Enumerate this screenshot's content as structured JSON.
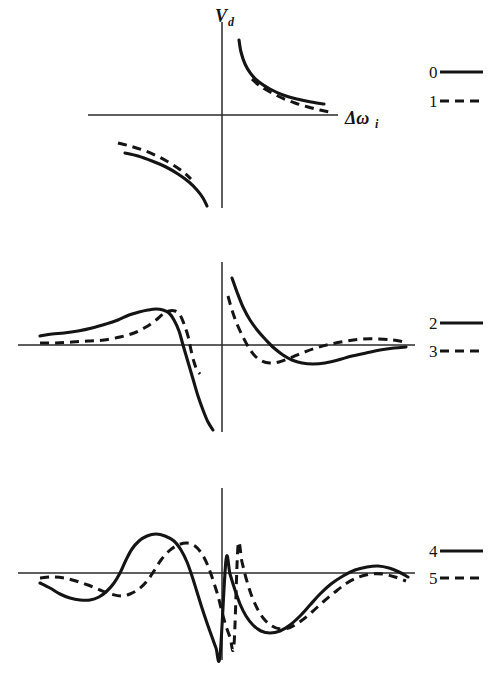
{
  "figure": {
    "background_color": "#ffffff",
    "ink_color": "#141414",
    "axis_color": "#2a2a2a",
    "y_axis_label": "V",
    "y_axis_label_sub": "d",
    "x_axis_label": "Δω",
    "x_axis_label_sub": "i"
  },
  "panels": [
    {
      "name": "top-panel",
      "origin": {
        "x": 222,
        "y": 115
      },
      "x_axis": {
        "x1": 88,
        "x2": 338,
        "y": 115
      },
      "y_axis": {
        "x": 222,
        "y1": 22,
        "y2": 208
      },
      "legend": [
        {
          "label": "0",
          "style": "solid",
          "label_x": 429,
          "line_x1": 440,
          "line_x2": 483,
          "y": 72
        },
        {
          "label": "1",
          "style": "dashed",
          "label_x": 429,
          "line_x1": 440,
          "line_x2": 483,
          "y": 101
        }
      ],
      "curves": [
        {
          "name": "curve-0-upper-right",
          "series": "0",
          "style": "solid",
          "points": [
            [
              239,
              40
            ],
            [
              241,
              52
            ],
            [
              245,
              64
            ],
            [
              251,
              74
            ],
            [
              259,
              82
            ],
            [
              270,
              89
            ],
            [
              283,
              95
            ],
            [
              297,
              99
            ],
            [
              311,
              102
            ],
            [
              324,
              104
            ]
          ]
        },
        {
          "name": "curve-1-upper-right",
          "series": "1",
          "style": "dashed",
          "points": [
            [
              252,
              79
            ],
            [
              260,
              86
            ],
            [
              270,
              92
            ],
            [
              282,
              98
            ],
            [
              295,
              103
            ],
            [
              308,
              107
            ],
            [
              320,
              110
            ],
            [
              330,
              112
            ]
          ]
        },
        {
          "name": "curve-0-lower-left",
          "series": "0",
          "style": "solid",
          "points": [
            [
              125,
              153
            ],
            [
              138,
              156
            ],
            [
              152,
              161
            ],
            [
              166,
              167
            ],
            [
              178,
              174
            ],
            [
              189,
              182
            ],
            [
              197,
              190
            ],
            [
              203,
              198
            ],
            [
              207,
              206
            ]
          ]
        },
        {
          "name": "curve-1-lower-left",
          "series": "1",
          "style": "dashed",
          "points": [
            [
              118,
              143
            ],
            [
              130,
              146
            ],
            [
              143,
              150
            ],
            [
              157,
              156
            ],
            [
              170,
              163
            ],
            [
              182,
              171
            ],
            [
              191,
              179
            ]
          ]
        }
      ]
    },
    {
      "name": "middle-panel",
      "origin": {
        "x": 222,
        "y": 345
      },
      "x_axis": {
        "x1": 18,
        "x2": 415,
        "y": 345
      },
      "y_axis": {
        "x": 222,
        "y1": 262,
        "y2": 432
      },
      "legend": [
        {
          "label": "2",
          "style": "solid",
          "label_x": 429,
          "line_x1": 440,
          "line_x2": 483,
          "y": 323
        },
        {
          "label": "3",
          "style": "dashed",
          "label_x": 429,
          "line_x1": 440,
          "line_x2": 483,
          "y": 351
        }
      ],
      "curves": [
        {
          "name": "curve-2-left-lobe",
          "series": "2",
          "style": "solid",
          "points": [
            [
              40,
              336
            ],
            [
              52,
              334
            ],
            [
              64,
              333
            ],
            [
              78,
              331
            ],
            [
              92,
              328
            ],
            [
              106,
              324
            ],
            [
              118,
              320
            ],
            [
              129,
              315
            ],
            [
              139,
              312
            ],
            [
              148,
              310
            ],
            [
              156,
              309
            ],
            [
              163,
              310
            ],
            [
              169,
              313
            ],
            [
              174,
              320
            ],
            [
              179,
              331
            ],
            [
              183,
              345
            ],
            [
              188,
              362
            ],
            [
              193,
              379
            ],
            [
              198,
              396
            ],
            [
              203,
              410
            ],
            [
              208,
              422
            ],
            [
              213,
              430
            ]
          ]
        },
        {
          "name": "curve-3-left-lobe",
          "series": "3",
          "style": "dashed",
          "points": [
            [
              40,
              343
            ],
            [
              56,
              343
            ],
            [
              72,
              342
            ],
            [
              88,
              341
            ],
            [
              104,
              340
            ],
            [
              120,
              337
            ],
            [
              134,
              333
            ],
            [
              146,
              327
            ],
            [
              156,
              320
            ],
            [
              163,
              314
            ],
            [
              169,
              311
            ],
            [
              175,
              311
            ],
            [
              180,
              315
            ],
            [
              184,
              324
            ],
            [
              188,
              336
            ],
            [
              191,
              350
            ],
            [
              194,
              362
            ],
            [
              197,
              370
            ],
            [
              200,
              374
            ]
          ]
        },
        {
          "name": "curve-2-right-lobe",
          "series": "2",
          "style": "solid",
          "points": [
            [
              232,
              278
            ],
            [
              237,
              292
            ],
            [
              243,
              307
            ],
            [
              250,
              320
            ],
            [
              258,
              331
            ],
            [
              266,
              340
            ],
            [
              274,
              348
            ],
            [
              283,
              355
            ],
            [
              292,
              360
            ],
            [
              302,
              363
            ],
            [
              313,
              364
            ],
            [
              325,
              363
            ],
            [
              338,
              360
            ],
            [
              352,
              356
            ],
            [
              366,
              353
            ],
            [
              380,
              350
            ],
            [
              394,
              348
            ],
            [
              406,
              347
            ]
          ]
        },
        {
          "name": "curve-3-right-lobe",
          "series": "3",
          "style": "dashed",
          "points": [
            [
              228,
              296
            ],
            [
              232,
              310
            ],
            [
              237,
              324
            ],
            [
              243,
              337
            ],
            [
              249,
              348
            ],
            [
              255,
              356
            ],
            [
              262,
              361
            ],
            [
              270,
              363
            ],
            [
              279,
              362
            ],
            [
              290,
              358
            ],
            [
              302,
              353
            ],
            [
              316,
              348
            ],
            [
              331,
              344
            ],
            [
              347,
              341
            ],
            [
              363,
              339
            ],
            [
              379,
              339
            ],
            [
              393,
              340
            ],
            [
              404,
              342
            ]
          ]
        }
      ]
    },
    {
      "name": "bottom-panel",
      "origin": {
        "x": 222,
        "y": 573
      },
      "x_axis": {
        "x1": 18,
        "x2": 415,
        "y": 573
      },
      "y_axis": {
        "x": 222,
        "y1": 488,
        "y2": 660
      },
      "legend": [
        {
          "label": "4",
          "style": "solid",
          "label_x": 429,
          "line_x1": 440,
          "line_x2": 483,
          "y": 551
        },
        {
          "label": "5",
          "style": "dashed",
          "label_x": 429,
          "line_x1": 440,
          "line_x2": 483,
          "y": 578
        }
      ],
      "curves": [
        {
          "name": "curve-4-oscillating",
          "series": "4",
          "style": "solid",
          "points": [
            [
              40,
              583
            ],
            [
              50,
              588
            ],
            [
              60,
              594
            ],
            [
              70,
              598
            ],
            [
              80,
              600
            ],
            [
              90,
              600
            ],
            [
              99,
              597
            ],
            [
              107,
              591
            ],
            [
              114,
              583
            ],
            [
              120,
              573
            ],
            [
              126,
              560
            ],
            [
              132,
              549
            ],
            [
              139,
              541
            ],
            [
              147,
              536
            ],
            [
              156,
              534
            ],
            [
              165,
              536
            ],
            [
              174,
              541
            ],
            [
              181,
              550
            ],
            [
              187,
              562
            ],
            [
              192,
              576
            ],
            [
              197,
              592
            ],
            [
              202,
              608
            ],
            [
              207,
              623
            ],
            [
              212,
              637
            ],
            [
              216,
              648
            ],
            [
              220,
              656
            ],
            [
              226,
              560
            ],
            [
              230,
              574
            ],
            [
              235,
              590
            ],
            [
              240,
              604
            ],
            [
              246,
              616
            ],
            [
              253,
              625
            ],
            [
              261,
              631
            ],
            [
              270,
              633
            ],
            [
              280,
              631
            ],
            [
              290,
              625
            ],
            [
              300,
              616
            ],
            [
              310,
              605
            ],
            [
              320,
              594
            ],
            [
              331,
              584
            ],
            [
              343,
              576
            ],
            [
              355,
              570
            ],
            [
              367,
              567
            ],
            [
              378,
              566
            ],
            [
              389,
              568
            ],
            [
              399,
              572
            ],
            [
              408,
              577
            ]
          ]
        },
        {
          "name": "curve-5-oscillating",
          "series": "5",
          "style": "dashed",
          "points": [
            [
              40,
              578
            ],
            [
              52,
              577
            ],
            [
              64,
              578
            ],
            [
              76,
              581
            ],
            [
              88,
              585
            ],
            [
              100,
              590
            ],
            [
              111,
              594
            ],
            [
              121,
              596
            ],
            [
              130,
              594
            ],
            [
              139,
              589
            ],
            [
              147,
              581
            ],
            [
              154,
              571
            ],
            [
              161,
              560
            ],
            [
              169,
              551
            ],
            [
              178,
              545
            ],
            [
              187,
              543
            ],
            [
              195,
              546
            ],
            [
              202,
              554
            ],
            [
              208,
              566
            ],
            [
              213,
              580
            ],
            [
              218,
              596
            ],
            [
              222,
              612
            ],
            [
              226,
              626
            ],
            [
              230,
              637
            ],
            [
              234,
              645
            ],
            [
              238,
              546
            ],
            [
              242,
              562
            ],
            [
              246,
              578
            ],
            [
              251,
              594
            ],
            [
              257,
              608
            ],
            [
              264,
              619
            ],
            [
              272,
              626
            ],
            [
              281,
              629
            ],
            [
              291,
              627
            ],
            [
              301,
              621
            ],
            [
              312,
              612
            ],
            [
              323,
              602
            ],
            [
              335,
              592
            ],
            [
              347,
              583
            ],
            [
              359,
              577
            ],
            [
              371,
              574
            ],
            [
              383,
              574
            ],
            [
              395,
              577
            ],
            [
              406,
              581
            ]
          ]
        }
      ]
    }
  ]
}
